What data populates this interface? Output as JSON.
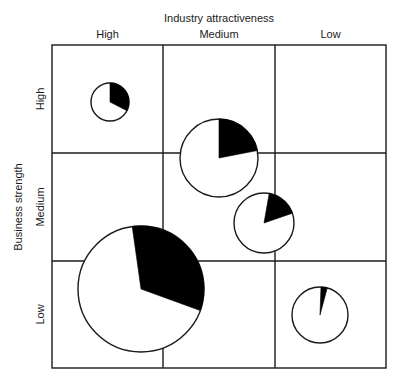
{
  "chart_data": {
    "type": "bubble-pie-matrix",
    "title": "",
    "x_axis": {
      "title": "Industry attractiveness",
      "categories": [
        "High",
        "Medium",
        "Low"
      ],
      "position": "top"
    },
    "y_axis": {
      "title": "Business strength",
      "categories": [
        "High",
        "Medium",
        "Low"
      ]
    },
    "grid": "3x3",
    "bubbles": [
      {
        "name": "bubble-1",
        "cx": 110,
        "cy": 102,
        "r": 19,
        "slice_start_deg": 0,
        "slice_end_deg": 117,
        "share_pct": 33
      },
      {
        "name": "bubble-2",
        "cx": 219,
        "cy": 158,
        "r": 39,
        "slice_start_deg": 0,
        "slice_end_deg": 79,
        "share_pct": 22
      },
      {
        "name": "bubble-3",
        "cx": 264,
        "cy": 223,
        "r": 30,
        "slice_start_deg": 10,
        "slice_end_deg": 71,
        "share_pct": 17
      },
      {
        "name": "bubble-4",
        "cx": 141,
        "cy": 289,
        "r": 63,
        "slice_start_deg": -8,
        "slice_end_deg": 110,
        "share_pct": 33
      },
      {
        "name": "bubble-5",
        "cx": 320,
        "cy": 315,
        "r": 28,
        "slice_start_deg": 2,
        "slice_end_deg": 15,
        "share_pct": 4
      }
    ],
    "layout": {
      "plot_left": 52,
      "plot_top": 45,
      "plot_right": 386,
      "plot_bottom": 368,
      "col_lines": [
        163,
        275
      ],
      "row_lines": [
        153,
        261
      ]
    },
    "colors": {
      "line": "#1a1a1a",
      "slice": "#000000",
      "background": "#ffffff"
    }
  }
}
